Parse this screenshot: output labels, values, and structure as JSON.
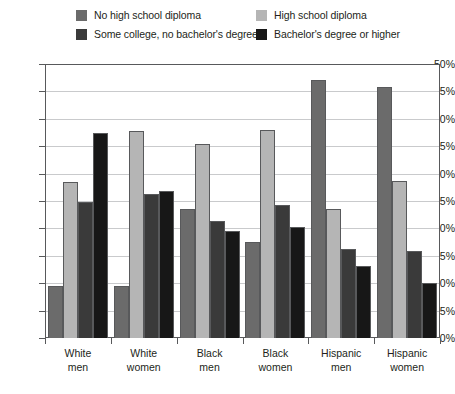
{
  "chart_data": {
    "type": "bar",
    "title": "",
    "xlabel": "",
    "ylabel": "",
    "ylim": [
      0,
      50
    ],
    "ytick_step": 5,
    "ytick_labels": [
      "50%",
      "45%",
      "40%",
      "35%",
      "30%",
      "25%",
      "20%",
      "15%",
      "10%",
      "5%",
      "0%"
    ],
    "grid": true,
    "legend_position": "top",
    "categories": [
      {
        "line1": "White",
        "line2": "men"
      },
      {
        "line1": "White",
        "line2": "women"
      },
      {
        "line1": "Black",
        "line2": "men"
      },
      {
        "line1": "Black",
        "line2": "women"
      },
      {
        "line1": "Hispanic",
        "line2": "men"
      },
      {
        "line1": "Hispanic",
        "line2": "women"
      }
    ],
    "series": [
      {
        "name": "No high school diploma",
        "color": "#6b6b6b",
        "values": [
          9.5,
          9.5,
          23.6,
          17.6,
          47.0,
          45.8
        ]
      },
      {
        "name": "High school diploma",
        "color": "#b5b5b5",
        "values": [
          28.5,
          37.8,
          35.4,
          38.0,
          23.6,
          28.6
        ]
      },
      {
        "name": "Some college, no bachelor's degree",
        "color": "#3a3a3a",
        "values": [
          24.9,
          26.3,
          21.4,
          24.3,
          16.2,
          15.8
        ]
      },
      {
        "name": "Bachelor's degree or higher",
        "color": "#171717",
        "values": [
          37.4,
          26.8,
          19.6,
          20.2,
          13.2,
          10.0
        ]
      }
    ]
  },
  "legend": {
    "items": [
      {
        "label": "No high school diploma",
        "color": "#6b6b6b"
      },
      {
        "label": "High school diploma",
        "color": "#b5b5b5"
      },
      {
        "label": "Some college, no bachelor's degree",
        "color": "#3a3a3a"
      },
      {
        "label": "Bachelor's degree or higher",
        "color": "#171717"
      }
    ]
  },
  "axis": {
    "border_color": "#58595b",
    "grid_color": "#c9cacc"
  }
}
